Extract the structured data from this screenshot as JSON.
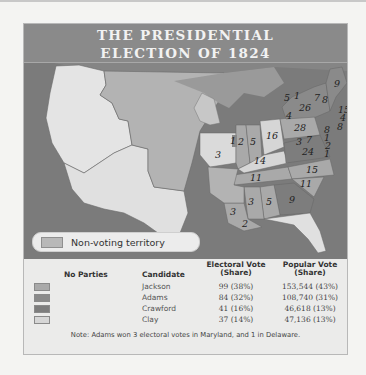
{
  "title": {
    "line1": "THE PRESIDENTIAL",
    "line2": "ELECTION OF 1824"
  },
  "map": {
    "non_voting_legend": "Non-voting territory",
    "state_electoral_votes": [
      {
        "state": "Maine",
        "votes": "9"
      },
      {
        "state": "New Hampshire",
        "votes": "8"
      },
      {
        "state": "Vermont",
        "votes": "7"
      },
      {
        "state": "Massachusetts",
        "votes": "15"
      },
      {
        "state": "Rhode Island",
        "votes": "4"
      },
      {
        "state": "Connecticut",
        "votes": "8"
      },
      {
        "state": "New York",
        "votes": "26"
      },
      {
        "state": "New York (Crawford)",
        "votes": "5"
      },
      {
        "state": "New York (Clay)",
        "votes": "4"
      },
      {
        "state": "New York (Jackson)",
        "votes": "1"
      },
      {
        "state": "New Jersey",
        "votes": "8"
      },
      {
        "state": "Delaware",
        "votes": "1"
      },
      {
        "state": "Delaware (Crawford)",
        "votes": "2"
      },
      {
        "state": "Maryland",
        "votes": "1"
      },
      {
        "state": "Pennsylvania",
        "votes": "28"
      },
      {
        "state": "Maryland (Jackson)",
        "votes": "7"
      },
      {
        "state": "Maryland (Adams)",
        "votes": "3"
      },
      {
        "state": "Virginia",
        "votes": "24"
      },
      {
        "state": "Ohio",
        "votes": "16"
      },
      {
        "state": "Indiana",
        "votes": "5"
      },
      {
        "state": "Illinois",
        "votes": "2"
      },
      {
        "state": "Illinois (Adams)",
        "votes": "1"
      },
      {
        "state": "Missouri",
        "votes": "3"
      },
      {
        "state": "Kentucky",
        "votes": "14"
      },
      {
        "state": "Tennessee",
        "votes": "11"
      },
      {
        "state": "North Carolina",
        "votes": "15"
      },
      {
        "state": "South Carolina",
        "votes": "11"
      },
      {
        "state": "Georgia",
        "votes": "9"
      },
      {
        "state": "Alabama",
        "votes": "5"
      },
      {
        "state": "Mississippi",
        "votes": "3"
      },
      {
        "state": "Louisiana (Jackson)",
        "votes": "3"
      },
      {
        "state": "Louisiana (Adams)",
        "votes": "2"
      }
    ]
  },
  "legend": {
    "headers": {
      "parties": "No Parties",
      "candidate": "Candidate",
      "electoral": "Electoral Vote (Share)",
      "popular": "Popular Vote (Share)"
    },
    "rows": [
      {
        "candidate": "Jackson",
        "electoral": "99 (38%)",
        "popular": "153,544 (43%)",
        "color": "#a9a9a9"
      },
      {
        "candidate": "Adams",
        "electoral": "84 (32%)",
        "popular": "108,740 (31%)",
        "color": "#8a8a8a"
      },
      {
        "candidate": "Crawford",
        "electoral": "41 (16%)",
        "popular": "46,618 (13%)",
        "color": "#7d7d7d"
      },
      {
        "candidate": "Clay",
        "electoral": "37 (14%)",
        "popular": "47,136 (13%)",
        "color": "#d6d6d6"
      }
    ],
    "note": "Note: Adams won 3 electoral votes in Maryland, and 1 in Delaware."
  }
}
